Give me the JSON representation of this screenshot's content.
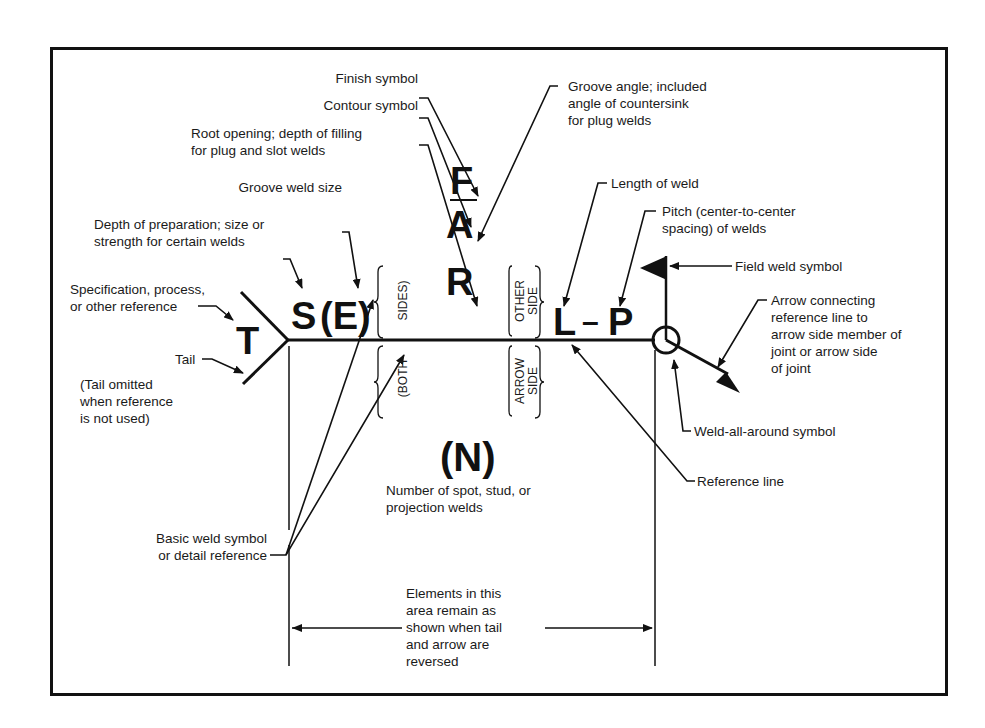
{
  "diagram": {
    "symbols": {
      "T": "T",
      "S": "S",
      "E": "(E)",
      "F": "F",
      "A": "A",
      "R": "R",
      "L": "L",
      "dash": "–",
      "P": "P",
      "N": "(N)"
    },
    "side_labels": {
      "both_sides_top": "SIDES)",
      "both_sides_bottom": "(BOTH",
      "other_side_1": "OTHER",
      "other_side_2": "SIDE",
      "arrow_side_1": "ARROW",
      "arrow_side_2": "SIDE"
    },
    "labels": {
      "finish_symbol": "Finish symbol",
      "contour_symbol": "Contour symbol",
      "root_opening_1": "Root opening; depth of filling",
      "root_opening_2": "for plug and slot welds",
      "groove_weld_size": "Groove weld size",
      "depth_prep_1": "Depth of preparation; size or",
      "depth_prep_2": "strength for certain welds",
      "specification_1": "Specification, process,",
      "specification_2": "or other reference",
      "tail": "Tail",
      "tail_omitted_1": "(Tail omitted",
      "tail_omitted_2": "when reference",
      "tail_omitted_3": "is not used)",
      "groove_angle_1": "Groove angle; included",
      "groove_angle_2": "angle of countersink",
      "groove_angle_3": "for plug welds",
      "length_of_weld": "Length of weld",
      "pitch_1": "Pitch (center-to-center",
      "pitch_2": "spacing) of welds",
      "field_weld": "Field weld symbol",
      "arrow_conn_1": "Arrow connecting",
      "arrow_conn_2": "reference line to",
      "arrow_conn_3": "arrow side member of",
      "arrow_conn_4": "joint or arrow side",
      "arrow_conn_5": "of joint",
      "weld_all_around": "Weld-all-around symbol",
      "reference_line": "Reference line",
      "number_spot_1": "Number of spot, stud, or",
      "number_spot_2": "projection welds",
      "basic_weld_1": "Basic weld symbol",
      "basic_weld_2": "or detail reference",
      "elements_1": "Elements in this",
      "elements_2": "area remain as",
      "elements_3": "shown when tail",
      "elements_4": "and arrow are",
      "elements_5": "reversed"
    },
    "colors": {
      "ink": "#111111",
      "background": "#ffffff"
    }
  }
}
